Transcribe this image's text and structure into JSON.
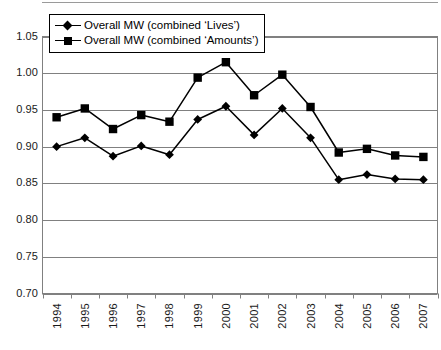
{
  "chart_data": {
    "type": "line",
    "title": "",
    "subtitle": "",
    "xlabel": "",
    "ylabel": "",
    "categories": [
      "1994",
      "1995",
      "1996",
      "1997",
      "1998",
      "1999",
      "2000",
      "2001",
      "2002",
      "2003",
      "2004",
      "2005",
      "2006",
      "2007"
    ],
    "series": [
      {
        "name": "Overall MW (combined 'Lives')",
        "marker": "diamond",
        "color": "#000000",
        "values": [
          0.9,
          0.912,
          0.887,
          0.901,
          0.889,
          0.937,
          0.955,
          0.916,
          0.952,
          0.912,
          0.855,
          0.862,
          0.856,
          0.855
        ]
      },
      {
        "name": "Overall MW (combined 'Amounts')",
        "marker": "square",
        "color": "#000000",
        "values": [
          0.94,
          0.952,
          0.924,
          0.943,
          0.934,
          0.994,
          1.015,
          0.97,
          0.998,
          0.954,
          0.892,
          0.897,
          0.888,
          0.886
        ]
      }
    ],
    "ylim": [
      0.7,
      1.05
    ],
    "yticks": [
      "0.70",
      "0.75",
      "0.80",
      "0.85",
      "0.90",
      "0.95",
      "1.00",
      "1.05"
    ],
    "ytick_values": [
      0.7,
      0.75,
      0.8,
      0.85,
      0.9,
      0.95,
      1.0,
      1.05
    ],
    "grid": true,
    "grid_color": "#808080",
    "legend_position": "top-left",
    "plot_background": "#ffffff",
    "axis_color": "#808080"
  },
  "legend": {
    "entries": [
      {
        "label": "Overall MW (combined ‘Lives’)",
        "marker": "diamond"
      },
      {
        "label": "Overall MW (combined ‘Amounts’)",
        "marker": "square"
      }
    ]
  }
}
